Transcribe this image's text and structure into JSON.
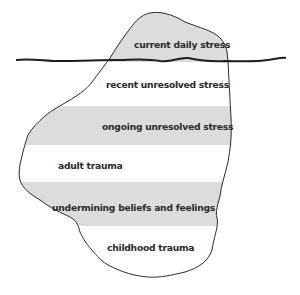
{
  "diagram": {
    "type": "iceberg",
    "colors": {
      "band_shaded": "#dcdcdc",
      "band_plain": "#ffffff",
      "outline": "#2b2b2b",
      "text": "#2a2a2a"
    },
    "waterline": {
      "label": ""
    },
    "layers": [
      {
        "label": "current daily stress",
        "shaded": true,
        "position": "above water"
      },
      {
        "label": "recent unresolved stress",
        "shaded": false,
        "position": "below water"
      },
      {
        "label": "ongoing unresolved stress",
        "shaded": true,
        "position": "below water"
      },
      {
        "label": "adult trauma",
        "shaded": false,
        "position": "below water"
      },
      {
        "label": "undermining beliefs and feelings",
        "shaded": true,
        "position": "below water"
      },
      {
        "label": "childhood trauma",
        "shaded": false,
        "position": "below water"
      }
    ]
  }
}
